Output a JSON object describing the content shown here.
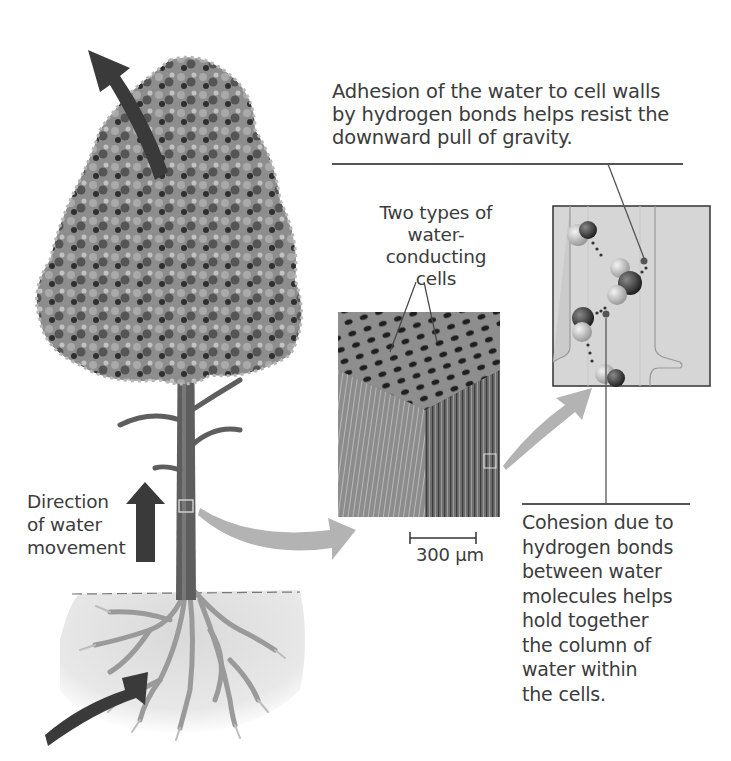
{
  "figure": {
    "labels": {
      "adhesion": [
        "Adhesion of the water to cell walls",
        "by hydrogen bonds helps resist the",
        "downward pull of gravity."
      ],
      "cell_types": [
        "Two types of",
        "water-conducting",
        "cells"
      ],
      "direction": [
        "Direction",
        "of water",
        "movement"
      ],
      "scale_bar": "300 µm",
      "cohesion": [
        "Cohesion due to",
        "hydrogen bonds",
        "between water",
        "molecules helps",
        "hold together",
        "the column of",
        "water within",
        "the cells."
      ]
    },
    "colors": {
      "arrow_dark": "#3a3a3a",
      "arrow_light": "#b3b3b3",
      "foliage_mid": "#8a8a8a",
      "foliage_dark": "#2e2e2e",
      "trunk": "#5e5e5e",
      "soil": "#e6e6e6",
      "micrograph": "#777777",
      "inset_bg": "#d8d8d8"
    }
  }
}
